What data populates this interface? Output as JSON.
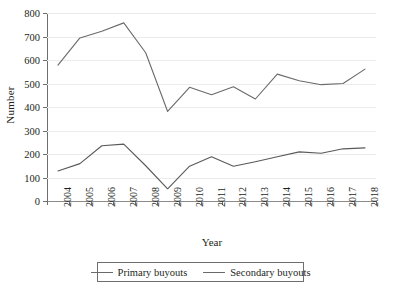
{
  "chart_data": {
    "type": "line",
    "title": "",
    "xlabel": "Year",
    "ylabel": "Number",
    "categories": [
      "2004",
      "2005",
      "2006",
      "2007",
      "2008",
      "2009",
      "2010",
      "2011",
      "2012",
      "2013",
      "2014",
      "2015",
      "2016",
      "2017",
      "2018"
    ],
    "series": [
      {
        "name": "Primary buyouts",
        "color": "#6a6a6a",
        "values": [
          578,
          694,
          722,
          758,
          631,
          381,
          484,
          452,
          486,
          434,
          540,
          512,
          495,
          500,
          561
        ]
      },
      {
        "name": "Secondary buyouts",
        "color": "#595959",
        "values": [
          128,
          159,
          235,
          242,
          150,
          52,
          148,
          188,
          148,
          167,
          188,
          209,
          203,
          222,
          226
        ]
      }
    ],
    "ylim": [
      0,
      800
    ],
    "yticks": [
      0,
      100,
      200,
      300,
      400,
      500,
      600,
      700,
      800
    ],
    "ytick_labels": [
      "0",
      "100",
      "200",
      "300",
      "400",
      "500",
      "600",
      "700",
      "800"
    ],
    "grid": true,
    "legend_position": "bottom"
  },
  "axes": {
    "y_title": "Number",
    "x_title": "Year"
  },
  "legend": {
    "entries": [
      {
        "label": "Primary buyouts"
      },
      {
        "label": "Secondary buyouts"
      }
    ]
  }
}
